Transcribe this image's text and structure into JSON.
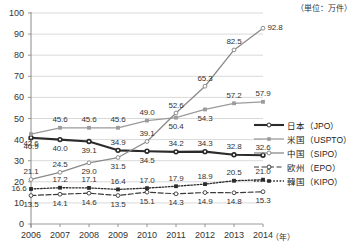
{
  "chart_data": {
    "type": "line",
    "title": "",
    "unit_note": "（単位：万件）",
    "xlabel": "（年）",
    "ylabel": "",
    "categories": [
      "2006",
      "2007",
      "2008",
      "2009",
      "2010",
      "2011",
      "2012",
      "2013",
      "2014"
    ],
    "ylim": [
      0,
      100
    ],
    "yticks": [
      "0",
      "10",
      "20",
      "30",
      "40",
      "50",
      "60",
      "70",
      "80",
      "90",
      "100"
    ],
    "grid": true,
    "legend_position": "right",
    "series": [
      {
        "name": "日本（JPO）",
        "key": "jpo",
        "color": "#2b2b2b",
        "marker": "open-circle",
        "dash": "none",
        "width": 2.1,
        "values": [
          40.9,
          40.0,
          39.1,
          34.9,
          34.5,
          34.2,
          34.3,
          32.8,
          32.6
        ],
        "label_pos": [
          "below",
          "below",
          "below",
          "above",
          "below",
          "above",
          "above",
          "above",
          "above"
        ]
      },
      {
        "name": "米国（USPTO）",
        "key": "uspto",
        "color": "#9b9b9b",
        "marker": "filled-square",
        "dash": "none",
        "width": 1.3,
        "values": [
          42.6,
          45.6,
          45.6,
          45.6,
          49.0,
          50.4,
          54.3,
          57.2,
          57.9
        ],
        "label_pos": [
          "below",
          "above",
          "above",
          "above",
          "above",
          "below",
          "below",
          "above",
          "above"
        ]
      },
      {
        "name": "中国（SIPO）",
        "key": "sipo",
        "color": "#8a8a8a",
        "marker": "open-circle",
        "dash": "none",
        "width": 1.3,
        "values": [
          21.1,
          24.5,
          29.0,
          31.5,
          39.1,
          52.6,
          65.3,
          82.5,
          92.8
        ],
        "label_pos": [
          "above",
          "above",
          "below",
          "below",
          "above",
          "above",
          "above",
          "above",
          "right"
        ]
      },
      {
        "name": "欧州（EPO）",
        "key": "epo",
        "color": "#3a3a3a",
        "marker": "open-circle",
        "dash": "dashed",
        "width": 1.2,
        "values": [
          13.5,
          14.1,
          14.6,
          13.5,
          15.1,
          14.3,
          14.9,
          14.8,
          15.3
        ],
        "label_pos": [
          "below",
          "below",
          "below",
          "below",
          "below",
          "below",
          "below",
          "below",
          "below"
        ]
      },
      {
        "name": "韓国（KIPO）",
        "key": "kipo",
        "color": "#2b2b2b",
        "marker": "filled-square",
        "dash": "dotted",
        "width": 1.3,
        "values": [
          16.6,
          17.2,
          17.1,
          16.4,
          17.0,
          17.9,
          18.9,
          20.5,
          21.0
        ],
        "label_pos": [
          "left",
          "above",
          "above",
          "above",
          "above",
          "above",
          "above",
          "above",
          "above"
        ]
      }
    ]
  },
  "legend": {
    "items": [
      {
        "label": "日本（JPO）"
      },
      {
        "label": "米国（USPTO）"
      },
      {
        "label": "中国（SIPO）"
      },
      {
        "label": "欧州（EPO）"
      },
      {
        "label": "韓国（KIPO）"
      }
    ]
  }
}
